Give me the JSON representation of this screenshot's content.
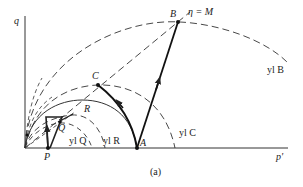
{
  "figure": {
    "caption": "(a)",
    "axes": {
      "y_label": "q",
      "x_label": "p'"
    },
    "points": {
      "A": "A",
      "B": "B",
      "C": "C",
      "P": "P",
      "Q": "Q",
      "R": "R"
    },
    "critical_state_line": "η = M",
    "yield_loci": {
      "B": "yl B",
      "C": "yl C",
      "R": "yl R",
      "Q": "yl Q"
    }
  }
}
